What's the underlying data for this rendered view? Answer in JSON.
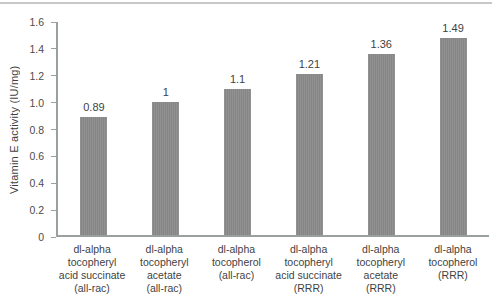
{
  "colors": {
    "bar": "#919191",
    "bar_stripe": "#868686",
    "axis": "#9aa0a0",
    "text": "#3f3f3f",
    "tick_text": "#4c4c4c",
    "top_rule": "#c7c7c7",
    "background": "#ffffff"
  },
  "chart_data": {
    "type": "bar",
    "ylabel": "Vitamin E activity (IU/mg)",
    "xlabel": "",
    "ylim": [
      0,
      1.6
    ],
    "yticks": [
      0,
      0.2,
      0.4,
      0.6,
      0.8,
      1.0,
      1.2,
      1.4,
      1.6
    ],
    "ytick_labels": [
      "0",
      "0.2",
      "0.4",
      "0.6",
      "0.8",
      "1.0",
      "1.2",
      "1.4",
      "1.6"
    ],
    "grid": false,
    "legend": false,
    "categories": [
      "dl-alpha\ntocopheryl\nacid succinate\n(all-rac)",
      "dl-alpha\ntocopheryl\nacetate\n(all-rac)",
      "dl-alpha\ntocopherol\n(all-rac)",
      "dl-alpha\ntocopheryl\nacid succinate\n(RRR)",
      "dl-alpha\ntocopheryl\nacetate\n(RRR)",
      "dl-alpha\ntocopherol\n(RRR)"
    ],
    "values": [
      0.89,
      1,
      1.1,
      1.21,
      1.36,
      1.49
    ],
    "value_labels": [
      "0.89",
      "1",
      "1.1",
      "1.21",
      "1.36",
      "1.49"
    ]
  }
}
